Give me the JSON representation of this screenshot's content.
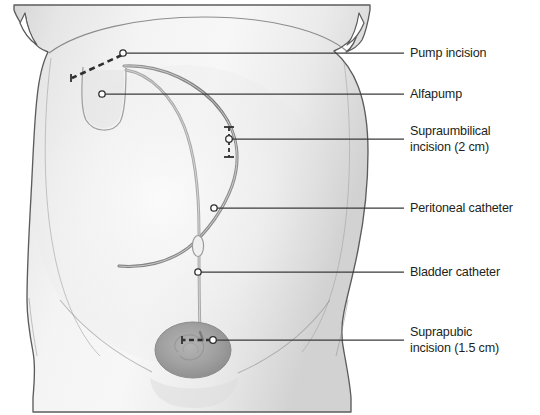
{
  "figure": {
    "type": "medical-illustration",
    "background_color": "#ffffff",
    "body_fill_color": "#e9e9e9",
    "body_outline_color": "#5a5a5a",
    "bladder_fill_color": "#a8a8a8",
    "tube_color": "#9a9a9a",
    "tube_dark_color": "#6e6e6e",
    "leader_line_color": "#3a3a3a",
    "text_color": "#231f20"
  },
  "callouts": [
    {
      "id": "pump-incision",
      "label": "Pump incision",
      "anchor_x": 123,
      "anchor_y": 53,
      "line_end_x": 404,
      "label_x": 410,
      "label_y": 46,
      "marker": "dashed-incision"
    },
    {
      "id": "alfapump",
      "label": "Alfapump",
      "anchor_x": 102,
      "anchor_y": 94,
      "line_end_x": 404,
      "label_x": 410,
      "label_y": 87,
      "marker": "device"
    },
    {
      "id": "supraumbilical-incision",
      "label": "Supraumbilical\nincision (2 cm)",
      "anchor_x": 229,
      "anchor_y": 139,
      "line_end_x": 404,
      "label_x": 410,
      "label_y": 124,
      "marker": "dimension-incision"
    },
    {
      "id": "peritoneal-catheter",
      "label": "Peritoneal catheter",
      "anchor_x": 214,
      "anchor_y": 208,
      "line_end_x": 404,
      "label_x": 410,
      "label_y": 201,
      "marker": "tube"
    },
    {
      "id": "bladder-catheter",
      "label": "Bladder catheter",
      "anchor_x": 198,
      "anchor_y": 272,
      "line_end_x": 404,
      "label_x": 410,
      "label_y": 265,
      "marker": "tube"
    },
    {
      "id": "suprapubic-incision",
      "label": "Suprapubic\nincision (1.5 cm)",
      "anchor_x": 213,
      "anchor_y": 340,
      "line_end_x": 404,
      "label_x": 410,
      "label_y": 325,
      "marker": "dashed-incision"
    }
  ],
  "anatomy": {
    "torso": "anterior abdominal wall, frontal view",
    "umbilicus": {
      "cx": 198,
      "cy": 246
    },
    "bladder": {
      "cx": 193,
      "cy": 350,
      "rx": 38,
      "ry": 28
    }
  }
}
